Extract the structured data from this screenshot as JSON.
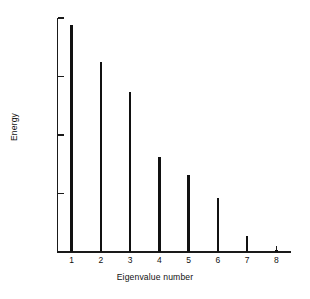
{
  "chart_data": {
    "type": "bar",
    "title": "",
    "subtitle": "",
    "xlabel": "Eigenvalue number",
    "ylabel": "Energy",
    "yscale": "log",
    "ylim": [
      0.0001,
      1
    ],
    "xlim": [
      0.5,
      8.5
    ],
    "grid": false,
    "legend": null,
    "categories": [
      "1",
      "2",
      "3",
      "4",
      "5",
      "6",
      "7",
      "8"
    ],
    "values": [
      0.77,
      0.18,
      0.054,
      0.0042,
      0.0021,
      0.00084,
      0.00019,
      0.00011
    ],
    "series": [
      {
        "name": "Energy",
        "values": [
          0.77,
          0.18,
          0.054,
          0.0042,
          0.0021,
          0.00084,
          0.00019,
          0.00011
        ]
      }
    ],
    "yticks": [
      {
        "value": 1,
        "mantissa": "1",
        "exponent": ""
      },
      {
        "value": 0.1,
        "mantissa": "10",
        "exponent": "−1"
      },
      {
        "value": 0.01,
        "mantissa": "10",
        "exponent": "−2"
      },
      {
        "value": 0.001,
        "mantissa": "10",
        "exponent": "−3"
      },
      {
        "value": 0.0001,
        "mantissa": "10",
        "exponent": "−4"
      }
    ],
    "ytick_labels": [
      "1",
      "10⁻¹",
      "10⁻²",
      "10⁻³",
      "10⁻⁴"
    ],
    "xtick_labels": [
      "1",
      "2",
      "3",
      "4",
      "5",
      "6",
      "7",
      "8"
    ],
    "bar_color": "#111111",
    "axis_color": "#1a1a1a",
    "background_color": "#ffffff"
  }
}
